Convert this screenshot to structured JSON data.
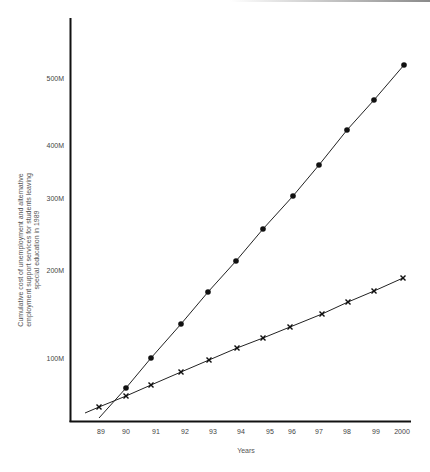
{
  "chart_data": {
    "type": "line",
    "title": "",
    "xlabel": "Years",
    "ylabel_lines": [
      "Cumulative cost of unemployment and alternative",
      "employment support services for students leaving",
      "special education in 1989"
    ],
    "ylabel": "Cumulative cost of unemployment and alternative employment support services for students leaving special education in 1989",
    "x_tick_labels": [
      "89",
      "90",
      "91",
      "92",
      "93",
      "94",
      "95",
      "96",
      "97",
      "98",
      "99",
      "2000"
    ],
    "y_tick_labels": [
      "100M",
      "200M",
      "300M",
      "400M",
      "500M"
    ],
    "ylim": [
      0,
      560000000
    ],
    "grid": false,
    "legend": null,
    "series": [
      {
        "name": "Unemployment (circles)",
        "marker": "circle",
        "categories": [
          "90",
          "91",
          "92",
          "93",
          "94",
          "95",
          "96",
          "97",
          "98",
          "99",
          "2000"
        ],
        "values_millions": [
          52,
          100,
          139,
          175,
          210,
          257,
          304,
          362,
          422,
          467,
          519
        ]
      },
      {
        "name": "Alternative employment support (crosses)",
        "marker": "x",
        "categories": [
          "89",
          "90",
          "91",
          "92",
          "93",
          "94",
          "95",
          "96",
          "97",
          "98",
          "99",
          "2000"
        ],
        "values_millions": [
          22,
          40,
          57,
          78,
          97,
          111,
          123,
          135,
          150,
          164,
          176,
          191
        ]
      }
    ]
  },
  "layout": {
    "axis_color": "#111111",
    "line_color": "#222222",
    "marker_color": "#111111",
    "x_tick_px": [
      101,
      126,
      156,
      185,
      213,
      241,
      270,
      292,
      319,
      347,
      376,
      402
    ],
    "y_tick_px": [
      358,
      270,
      198,
      145,
      78
    ],
    "circle_px": [
      [
        126,
        388
      ],
      [
        151,
        358
      ],
      [
        181,
        324
      ],
      [
        208,
        292
      ],
      [
        236,
        261
      ],
      [
        263,
        229
      ],
      [
        293,
        196
      ],
      [
        319,
        165
      ],
      [
        347,
        130
      ],
      [
        374,
        100
      ],
      [
        404,
        65
      ]
    ],
    "circle_line_start": [
      99,
      418
    ],
    "x_px": [
      [
        99,
        407
      ],
      [
        126,
        396
      ],
      [
        151,
        385
      ],
      [
        181,
        372
      ],
      [
        209,
        360
      ],
      [
        237,
        348
      ],
      [
        263,
        338
      ],
      [
        290,
        327
      ],
      [
        322,
        314
      ],
      [
        348,
        302
      ],
      [
        374,
        291
      ],
      [
        403,
        278
      ]
    ],
    "x_line_start": [
      85,
      413
    ]
  }
}
